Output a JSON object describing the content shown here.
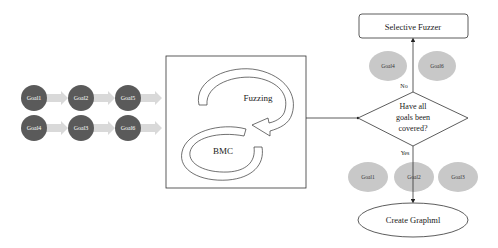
{
  "colors": {
    "goal_dark": "#5a5a5a",
    "goal_light": "#c8c8c8",
    "arrow_fill": "#d9d9d9",
    "stroke": "#333333"
  },
  "goal_grid": {
    "rows": [
      [
        "Goal1",
        "Goal2",
        "Goal5"
      ],
      [
        "Goal4",
        "Goal3",
        "Goal6"
      ]
    ]
  },
  "loop": {
    "fuzzing_label": "Fuzzing",
    "bmc_label": "BMC"
  },
  "flow": {
    "selective_fuzzer_label": "Selective Fuzzer",
    "decision_lines": [
      "Have all",
      "goals been",
      "covered?"
    ],
    "no_label": "No",
    "yes_label": "Yes",
    "uncovered_goals": [
      "Goal4",
      "Goal6"
    ],
    "covered_goals": [
      "Goal1",
      "Goal2",
      "Goal3"
    ],
    "create_graphml_label": "Create Graphml"
  }
}
